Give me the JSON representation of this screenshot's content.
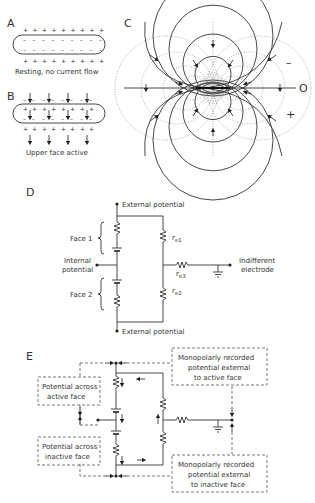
{
  "figure": {
    "panel_a": {
      "letter": "A",
      "caption": "Resting, no current flow",
      "outer_charge": "+",
      "inner_charge": "–"
    },
    "panel_b": {
      "letter": "B",
      "caption": "Upper face active"
    },
    "panel_c": {
      "letter": "C",
      "label_minus": "–",
      "label_zero": "O",
      "label_plus": "+"
    },
    "panel_d": {
      "letter": "D",
      "external_top": "External potential",
      "external_bottom": "External potential",
      "face1": "Face 1",
      "face2": "Face 2",
      "internal_line1": "Internal",
      "internal_line2": "potential",
      "re1": "r",
      "re1_sub": "e1",
      "re2": "r",
      "re2_sub": "e2",
      "re3": "r",
      "re3_sub": "e3",
      "indifferent_line1": "Indifferent",
      "indifferent_line2": "electrode"
    },
    "panel_e": {
      "letter": "E",
      "active_line1": "Potential across",
      "active_line2": "active face",
      "inactive_line1": "Potential across",
      "inactive_line2": "inactive face",
      "mono_active_line1": "Monopolarly recorded",
      "mono_active_line2": "potential external",
      "mono_active_line3": "to active face",
      "mono_inactive_line1": "Monopolarly recorded",
      "mono_inactive_line2": "potential external",
      "mono_inactive_line3": "to inactive face"
    }
  }
}
